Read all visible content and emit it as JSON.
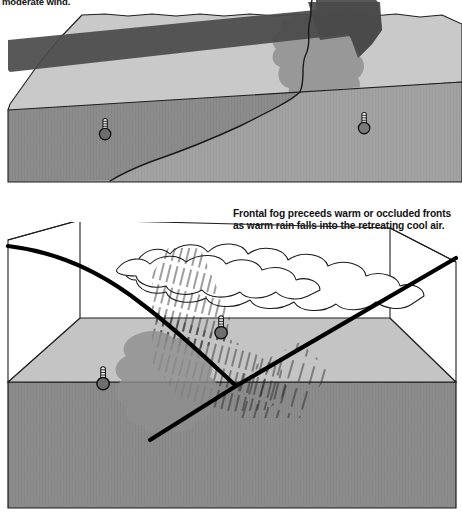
{
  "document": {
    "title": "Frontal fog formation diagram",
    "figure_type": "3D block meteorological cross-section, two panels"
  },
  "captions": {
    "top": "moderate wind.",
    "bottom": "Frontal fog preceeds warm or occluded fronts as warm rain falls into the retreating cool air."
  },
  "colors": {
    "paper": "#ffffff",
    "outline": "#1a1a1a",
    "ground_dark": "#8a8a8a",
    "ground_mid": "#9c9c9c",
    "ground_light": "#c4c4c4",
    "surface_light": "#c9c9c9",
    "arrow_dark": "#4a4a4a",
    "fog_gray": "#8f8f8f",
    "thermometer_body": "#6e6e6e",
    "front_line": "#000000"
  },
  "panel_top": {
    "name": "advection-fog-block",
    "description": "Terrain block with wind arrow flowing over a front line, fog forming downwind",
    "elements": {
      "wind_arrow": "wind-arrow",
      "fog_patch": "fog-patch",
      "front_line": "surface-front-line",
      "thermometer_cool": "thermometer-cool-air",
      "thermometer_warm": "thermometer-warm-air"
    }
  },
  "panel_bottom": {
    "name": "frontal-fog-block",
    "description": "Warm frontal surface sloping over retreating cool air, rain falling through, fog at the ground",
    "elements": {
      "frontal_surface": "warm-frontal-surface",
      "cloud_deck": "cloud-deck",
      "rain_shaft_upper": "rain-shaft-upper",
      "rain_shaft_lower": "rain-shaft-lower",
      "fog_patch": "fog-patch",
      "thermometer_warm": "thermometer-warm-air",
      "thermometer_cool": "thermometer-cool-air",
      "ground_slab": "ground-slab",
      "base_slab": "base-slab"
    }
  }
}
